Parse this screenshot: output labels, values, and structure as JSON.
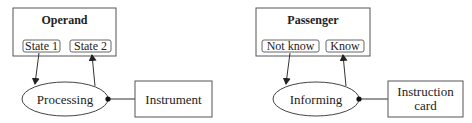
{
  "diagrams": [
    {
      "container": {
        "title": "Operand",
        "states": [
          "State 1",
          "State 2"
        ]
      },
      "process": "Processing",
      "instrument": {
        "lines": [
          "Instrument"
        ]
      }
    },
    {
      "container": {
        "title": "Passenger",
        "states": [
          "Not know",
          "Know"
        ]
      },
      "process": "Informing",
      "instrument": {
        "lines": [
          "Instruction",
          "card"
        ]
      }
    }
  ],
  "colors": {
    "stroke": "#555555",
    "text": "#222222",
    "background": "#ffffff"
  }
}
